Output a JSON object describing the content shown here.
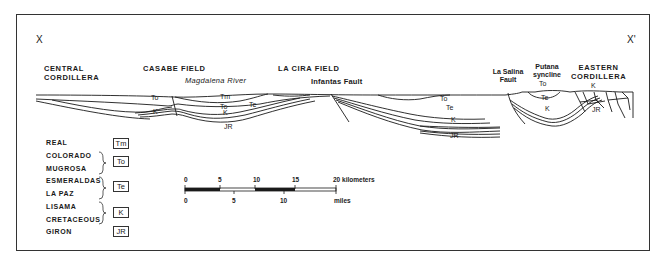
{
  "section": {
    "start_label": "X",
    "end_label": "X'",
    "locations": [
      {
        "id": "central-cordillera",
        "lines": [
          "CENTRAL",
          "CORDILLERA"
        ]
      },
      {
        "id": "casabe-field",
        "lines": [
          "CASABE FIELD"
        ]
      },
      {
        "id": "la-cira-field",
        "lines": [
          "LA CIRA FIELD"
        ]
      },
      {
        "id": "la-salina-fault",
        "lines": [
          "La Salina",
          "Fault"
        ]
      },
      {
        "id": "putana-syncline",
        "lines": [
          "Putana",
          "syncline"
        ]
      },
      {
        "id": "eastern-cordillera",
        "lines": [
          "EASTERN",
          "CORDILLERA"
        ]
      }
    ],
    "river_label": "Magdalena River",
    "fault_label": "Infantas Fault",
    "unit_labels": {
      "tm": "Tm",
      "to": "To",
      "te": "Te",
      "k": "K",
      "jr": "JR"
    }
  },
  "legend": {
    "items": [
      {
        "names": [
          "REAL"
        ],
        "code": "Tm"
      },
      {
        "names": [
          "COLORADO",
          "MUGROSA"
        ],
        "code": "To"
      },
      {
        "names": [
          "ESMERALDAS",
          "LA PAZ"
        ],
        "code": "Te"
      },
      {
        "names": [
          "LISAMA",
          "CRETACEOUS"
        ],
        "code": "K"
      },
      {
        "names": [
          "GIRON"
        ],
        "code": "JR"
      }
    ]
  },
  "scale_bar": {
    "km_ticks": [
      "0",
      "5",
      "10",
      "15",
      "20"
    ],
    "km_unit": "kilometers",
    "mile_ticks": [
      "0",
      "5",
      "10"
    ],
    "mile_unit": "miles"
  },
  "colors": {
    "line": "#1a1a1a",
    "frame": "#333333",
    "background": "#ffffff"
  }
}
